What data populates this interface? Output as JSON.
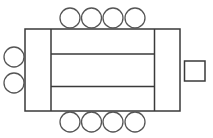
{
  "diagram": {
    "type": "seating-layout",
    "colors": {
      "stroke": "#3a3a3a",
      "chair_stroke": "#555555",
      "background": "#ffffff"
    },
    "table": {
      "outer": {
        "x": 25,
        "y": 29,
        "width": 155,
        "height": 82
      },
      "left_end_panel": {
        "x": 25,
        "y": 29,
        "width": 26,
        "height": 82
      },
      "right_end_panel": {
        "x": 154.5,
        "y": 29,
        "width": 25.5,
        "height": 82
      },
      "middle_sections": [
        {
          "x": 51,
          "y": 29,
          "width": 103.5,
          "height": 25
        },
        {
          "x": 51,
          "y": 54,
          "width": 103.5,
          "height": 32.5
        },
        {
          "x": 51,
          "y": 86.5,
          "width": 103.5,
          "height": 24.5
        }
      ]
    },
    "chairs": {
      "radius": 10,
      "top": [
        {
          "cx": 70,
          "cy": 18
        },
        {
          "cx": 91.5,
          "cy": 18
        },
        {
          "cx": 113,
          "cy": 18
        },
        {
          "cx": 135,
          "cy": 18
        }
      ],
      "bottom": [
        {
          "cx": 70,
          "cy": 122
        },
        {
          "cx": 91.5,
          "cy": 122
        },
        {
          "cx": 113,
          "cy": 122
        },
        {
          "cx": 135,
          "cy": 122
        }
      ],
      "left": [
        {
          "cx": 14,
          "cy": 57
        },
        {
          "cx": 14,
          "cy": 83
        }
      ]
    },
    "side_square": {
      "x": 184.5,
      "y": 61,
      "width": 20.5,
      "height": 20
    },
    "counts": {
      "top_chairs": 4,
      "bottom_chairs": 4,
      "left_chairs": 2,
      "right_squares": 1
    }
  }
}
